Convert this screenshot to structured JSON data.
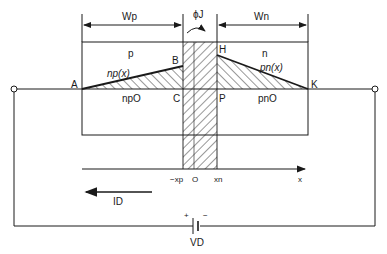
{
  "diagram": {
    "colors": {
      "line": "#1a1a1a",
      "background": "#ffffff",
      "hatch": "#1a1a1a"
    },
    "dimensions": {
      "wp_label": "Wp",
      "wn_label": "Wn",
      "phi_label": "ϕJ"
    },
    "regions": {
      "p_label": "p",
      "n_label": "n"
    },
    "points": {
      "A": "A",
      "B": "B",
      "C": "C",
      "H": "H",
      "P": "P",
      "K": "K"
    },
    "curves": {
      "np_label": "np(x)",
      "pn_label": "pn(x)",
      "np0_label": "npO",
      "pn0_label": "pnO"
    },
    "axis": {
      "neg_xp": "−xp",
      "origin": "O",
      "xn": "xn",
      "x": "x"
    },
    "current": {
      "label": "ID"
    },
    "source": {
      "plus": "+",
      "minus": "−",
      "label": "VD"
    }
  }
}
